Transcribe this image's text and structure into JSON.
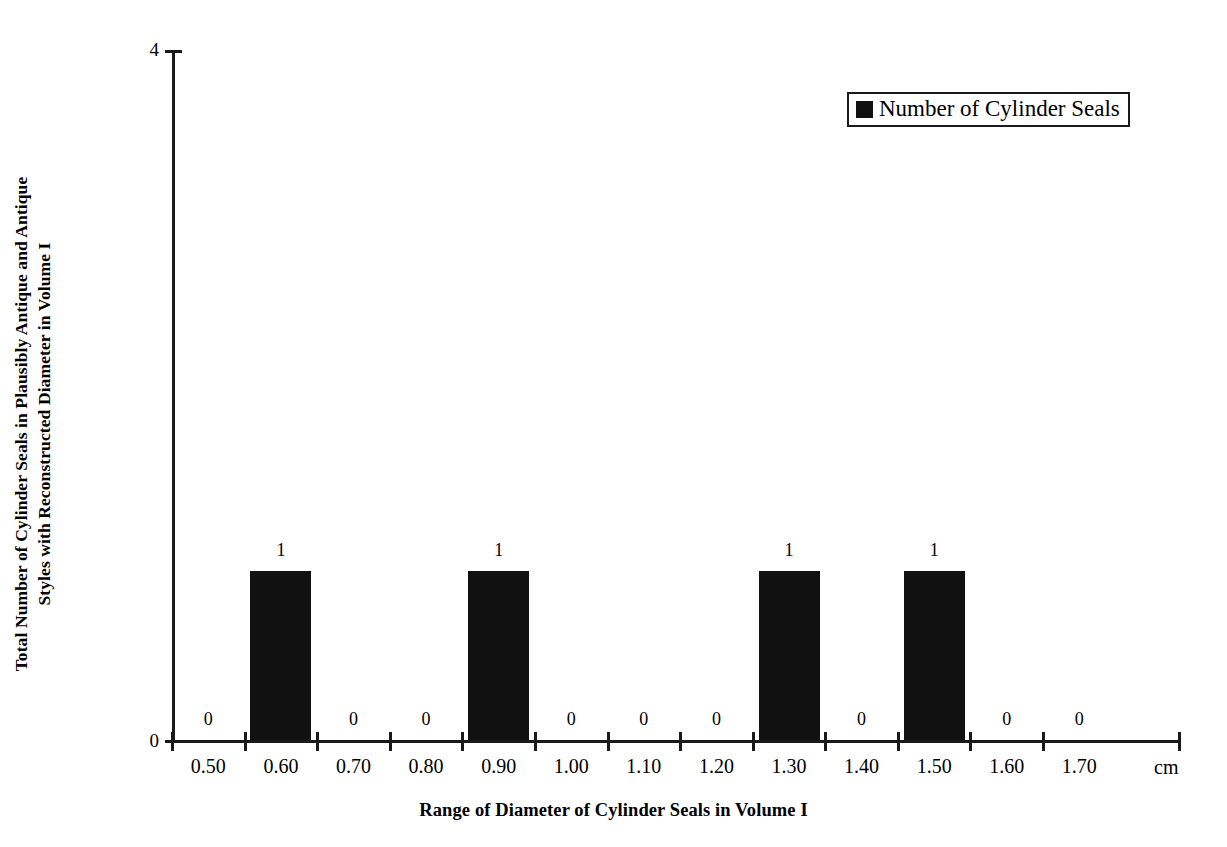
{
  "chart_data": {
    "type": "bar",
    "title": "",
    "xlabel": "Range of Diameter of Cylinder Seals in Volume I",
    "ylabel": "Total Number of Cylinder Seals in Plausibly Antique and Antique Styles with Reconstructed Diameter in Volume I",
    "ylabel_line1": "Total Number of Cylinder Seals in Plausibly Antique and Antique",
    "ylabel_line2": "Styles with Reconstructed Diameter in Volume I",
    "x_unit": "cm",
    "categories": [
      "0.50",
      "0.60",
      "0.70",
      "0.80",
      "0.90",
      "1.00",
      "1.10",
      "1.20",
      "1.30",
      "1.40",
      "1.50",
      "1.60",
      "1.70"
    ],
    "values": [
      0,
      1,
      0,
      0,
      1,
      0,
      0,
      0,
      1,
      0,
      1,
      0,
      0
    ],
    "data_labels": [
      "0",
      "1",
      "0",
      "0",
      "1",
      "0",
      "0",
      "0",
      "1",
      "0",
      "1",
      "0",
      "0"
    ],
    "ylim": [
      0,
      4
    ],
    "ytick_labels": [
      "0",
      "4"
    ],
    "grid": false,
    "legend_position": "top-right",
    "series": [
      {
        "name": "Number of Cylinder Seals",
        "color": "#111111",
        "values": [
          0,
          1,
          0,
          0,
          1,
          0,
          0,
          0,
          1,
          0,
          1,
          0,
          0
        ]
      }
    ]
  },
  "legend": {
    "entries": [
      {
        "label": "Number of Cylinder Seals",
        "color": "#111111"
      }
    ]
  },
  "axes": {
    "y_max_label": "4",
    "y_min_label": "0"
  }
}
